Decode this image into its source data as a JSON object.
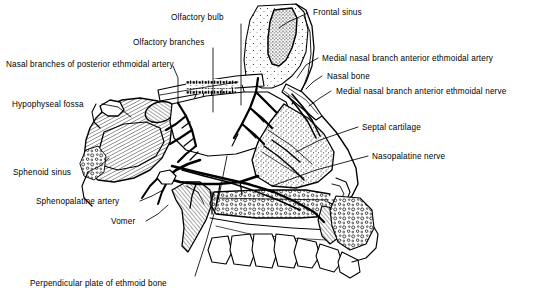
{
  "figure": {
    "background_color": "#ffffff",
    "ink_color": "#000000",
    "width": 548,
    "height": 302
  },
  "labels": [
    {
      "id": "frontal-sinus",
      "text": "Frontal sinus",
      "x": 313,
      "y": 8,
      "align": "left"
    },
    {
      "id": "olfactory-bulb",
      "text": "Olfactory bulb",
      "x": 171,
      "y": 13,
      "align": "left"
    },
    {
      "id": "olfactory-branches",
      "text": "Olfactory branches",
      "x": 133,
      "y": 38,
      "align": "left"
    },
    {
      "id": "nasal-branches-post-ethmoidal-artery",
      "text": "Nasal branches of posterior ethmoidal artery",
      "x": 6,
      "y": 60,
      "align": "left"
    },
    {
      "id": "medial-nasal-branch-anterior-ethmoidal-artery",
      "text": "Medial nasal branch anterior ethmoidal artery",
      "x": 322,
      "y": 54,
      "align": "left"
    },
    {
      "id": "nasal-bone",
      "text": "Nasal bone",
      "x": 327,
      "y": 72,
      "align": "left"
    },
    {
      "id": "medial-nasal-branch-anterior-ethmoidal-nerve",
      "text": "Medial nasal branch anterior ethmoidal nerve",
      "x": 336,
      "y": 87,
      "align": "left"
    },
    {
      "id": "hypophyseal-fossa",
      "text": "Hypophyseal fossa",
      "x": 12,
      "y": 100,
      "align": "left"
    },
    {
      "id": "septal-cartilage",
      "text": "Septal cartilage",
      "x": 362,
      "y": 123,
      "align": "left"
    },
    {
      "id": "nasopalatine-nerve",
      "text": "Nasopalatine nerve",
      "x": 372,
      "y": 152,
      "align": "left"
    },
    {
      "id": "sphenoid-sinus",
      "text": "Sphenoid sinus",
      "x": 13,
      "y": 168,
      "align": "left"
    },
    {
      "id": "sphenopalatine-artery",
      "text": "Sphenopalatine artery",
      "x": 36,
      "y": 197,
      "align": "left"
    },
    {
      "id": "vomer",
      "text": "Vomer",
      "x": 111,
      "y": 217,
      "align": "left"
    },
    {
      "id": "perpendicular-plate-ethmoid-bone",
      "text": "Perpendicular plate of ethmoid bone",
      "x": 30,
      "y": 279,
      "align": "left"
    }
  ],
  "leader_lines": [
    {
      "id": "leader-frontal-sinus",
      "points": "308,13 288,22 279,28"
    },
    {
      "id": "leader-olfactory-bulb",
      "points": "241,24 241,105"
    },
    {
      "id": "leader-olfactory-branches",
      "points": "213,48 213,112"
    },
    {
      "id": "leader-nasal-branches-post-ethmoidal-artery",
      "points": "173,66 178,78 178,103"
    },
    {
      "id": "leader-medial-nasal-artery",
      "points": "318,58 306,65 297,78"
    },
    {
      "id": "leader-nasal-bone",
      "points": "322,76 313,82 306,89"
    },
    {
      "id": "leader-medial-nasal-nerve",
      "points": "331,91 320,98 309,106"
    },
    {
      "id": "leader-hypophyseal-fossa",
      "points": "102,104 118,107 131,117"
    },
    {
      "id": "leader-septal-cartilage",
      "points": "358,127 320,140 296,152"
    },
    {
      "id": "leader-nasopalatine-nerve",
      "points": "368,156 316,170 272,186"
    },
    {
      "id": "leader-sphenoid-sinus",
      "points": "88,172 100,166 109,158"
    },
    {
      "id": "leader-sphenopalatine-artery",
      "points": "140,201 152,196 163,190"
    },
    {
      "id": "leader-vomer",
      "points": "146,221 158,214 168,205"
    },
    {
      "id": "leader-perpendicular-plate",
      "points": "195,276 206,242 219,196 227,156"
    }
  ],
  "structures": [
    {
      "id": "frontal-sinus-cavity",
      "name": "frontal-sinus-cavity",
      "fill": "stipple-dense"
    },
    {
      "id": "frontal-bone",
      "name": "frontal-bone",
      "fill": "stipple-light"
    },
    {
      "id": "nasal-bone-plate",
      "name": "nasal-bone-plate",
      "fill": "outline"
    },
    {
      "id": "cribriform-plate",
      "name": "cribriform-plate",
      "fill": "perforated"
    },
    {
      "id": "sphenoid-body",
      "name": "sphenoid-body",
      "fill": "hatch"
    },
    {
      "id": "sphenoid-sinus-cavity",
      "name": "sphenoid-sinus-cavity",
      "fill": "hatch"
    },
    {
      "id": "hypophyseal-fossa-notch",
      "name": "hypophyseal-fossa-notch",
      "fill": "outline"
    },
    {
      "id": "perpendicular-plate",
      "name": "perpendicular-plate",
      "fill": "plain"
    },
    {
      "id": "vomer-bone",
      "name": "vomer-bone",
      "fill": "hatch"
    },
    {
      "id": "septal-cartilage-plate",
      "name": "septal-cartilage-plate",
      "fill": "stipple"
    },
    {
      "id": "hard-palate",
      "name": "hard-palate",
      "fill": "cancellous"
    },
    {
      "id": "maxillary-teeth",
      "name": "maxillary-teeth",
      "fill": "outline"
    },
    {
      "id": "incisive-canal",
      "name": "incisive-canal",
      "fill": "hatch"
    },
    {
      "id": "nasopalatine-nerve-trunk",
      "name": "nasopalatine-nerve-trunk",
      "fill": "solid"
    },
    {
      "id": "sphenopalatine-artery-trunk",
      "name": "sphenopalatine-artery-trunk",
      "fill": "solid"
    },
    {
      "id": "posterior-ethmoidal-vessels",
      "name": "posterior-ethmoidal-vessels",
      "fill": "solid"
    },
    {
      "id": "anterior-ethmoidal-vessels",
      "name": "anterior-ethmoidal-vessels",
      "fill": "solid"
    },
    {
      "id": "olfactory-nerve-fibers",
      "name": "olfactory-nerve-fibers",
      "fill": "solid"
    },
    {
      "id": "external-nose-profile",
      "name": "external-nose-profile",
      "fill": "outline"
    }
  ]
}
